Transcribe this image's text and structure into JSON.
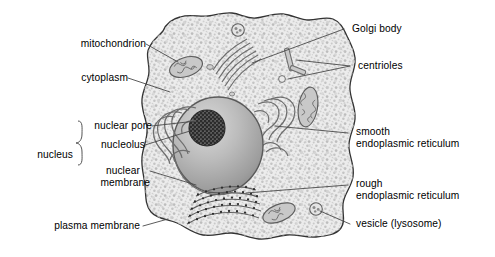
{
  "figure": {
    "type": "labeled biological diagram",
    "colors": {
      "outline": "#3a3a3a",
      "cytoplasm_fill": "#e8e8e8",
      "cytoplasm_speckle": "#b9b9b9",
      "nucleus_fill": "#b0b0b0",
      "nucleolus_fill": "#3f3f3f",
      "organelle_fill": "#c6c6c6",
      "leader_line": "#4a4a4a",
      "text": "#000000",
      "background": "#ffffff"
    }
  },
  "labels": {
    "mitochondrion": "mitochondrion",
    "cytoplasm": "cytoplasm",
    "nuclear_pore": "nuclear pore",
    "nucleolus": "nucleolus",
    "nuclear_membrane_l1": "nuclear",
    "nuclear_membrane_l2": "membrane",
    "nucleus_group": "nucleus",
    "plasma_membrane": "plasma membrane",
    "golgi_body": "Golgi body",
    "centrioles": "centrioles",
    "smooth_er_l1": "smooth",
    "smooth_er_l2": "endoplasmic reticulum",
    "rough_er_l1": "rough",
    "rough_er_l2": "endoplasmic reticulum",
    "vesicle": "vesicle (lysosome)"
  },
  "structures": [
    {
      "name": "plasma membrane",
      "side": "left"
    },
    {
      "name": "cytoplasm",
      "side": "left"
    },
    {
      "name": "mitochondrion",
      "side": "left",
      "count": 3
    },
    {
      "name": "nucleus",
      "side": "left"
    },
    {
      "name": "nucleolus",
      "side": "left"
    },
    {
      "name": "nuclear pore",
      "side": "left"
    },
    {
      "name": "nuclear membrane",
      "side": "left"
    },
    {
      "name": "Golgi body",
      "side": "right"
    },
    {
      "name": "centrioles",
      "side": "right"
    },
    {
      "name": "smooth endoplasmic reticulum",
      "side": "right"
    },
    {
      "name": "rough endoplasmic reticulum",
      "side": "right"
    },
    {
      "name": "vesicle (lysosome)",
      "side": "right",
      "count": 2
    }
  ]
}
